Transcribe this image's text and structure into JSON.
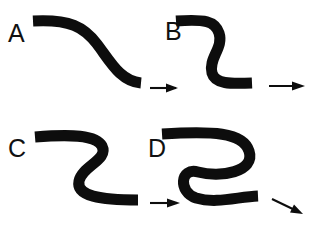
{
  "figure": {
    "background_color": "#ffffff",
    "ink_color": "#0d0d0d",
    "width": 318,
    "height": 230,
    "panels": [
      {
        "id": "A",
        "label": "A",
        "label_x": 8,
        "label_y": 42,
        "ribbon_width": 11,
        "description": "gentle S-shaped ribbon, shallow single inflection",
        "curvature_rank": 1,
        "path": "M 33 21 C 70 19, 84 27, 97 44 C 110 61, 120 81, 141 83",
        "arrow": {
          "name": "arrow-right-a",
          "x1": 150,
          "y1": 88,
          "x2": 176,
          "y2": 88,
          "head": "176,88 167,84 167,92",
          "direction": "right"
        }
      },
      {
        "id": "B",
        "label": "B",
        "label_x": 165,
        "label_y": 40,
        "ribbon_width": 11,
        "description": "S-shaped ribbon with moderate hairpin bends",
        "curvature_rank": 2,
        "path": "M 176 21 C 205 19, 215 21, 219 33 C 224 48, 208 58, 212 73 C 215 84, 230 84, 252 83",
        "arrow": {
          "name": "arrow-right-b",
          "x1": 267,
          "y1": 86,
          "x2": 302,
          "y2": 86,
          "head": "302,86, 292,82, 292,90",
          "direction": "right"
        }
      },
      {
        "id": "C",
        "label": "C",
        "label_x": 8,
        "label_y": 157,
        "ribbon_width": 11,
        "description": "tight Z/S-shaped ribbon with sharp reversed bends",
        "curvature_rank": 3,
        "path": "M 35 137 C 72 134, 96 135, 102 146 C 109 160, 82 166, 79 181 C 76 196, 100 200, 138 200",
        "arrow": {
          "name": "arrow-right-c",
          "x1": 150,
          "y1": 203,
          "x2": 178,
          "y2": 203,
          "head": "178,203 169,199 169,207",
          "direction": "right"
        }
      },
      {
        "id": "D",
        "label": "D",
        "label_x": 148,
        "label_y": 157,
        "ribbon_width": 11,
        "description": "tightly coiled S-shaped ribbon, deepest hairpin loops",
        "curvature_rank": 4,
        "path": "M 162 134 C 212 131, 243 132, 249 151 C 256 172, 220 178, 198 172 C 180 167, 178 192, 196 198 C 216 204, 237 197, 258 196",
        "arrow": {
          "name": "arrow-down-right-d",
          "x1": 272,
          "y1": 198,
          "x2": 302,
          "y2": 213,
          "head": "302,213 291,211 295,204",
          "direction": "down-right"
        }
      }
    ]
  }
}
